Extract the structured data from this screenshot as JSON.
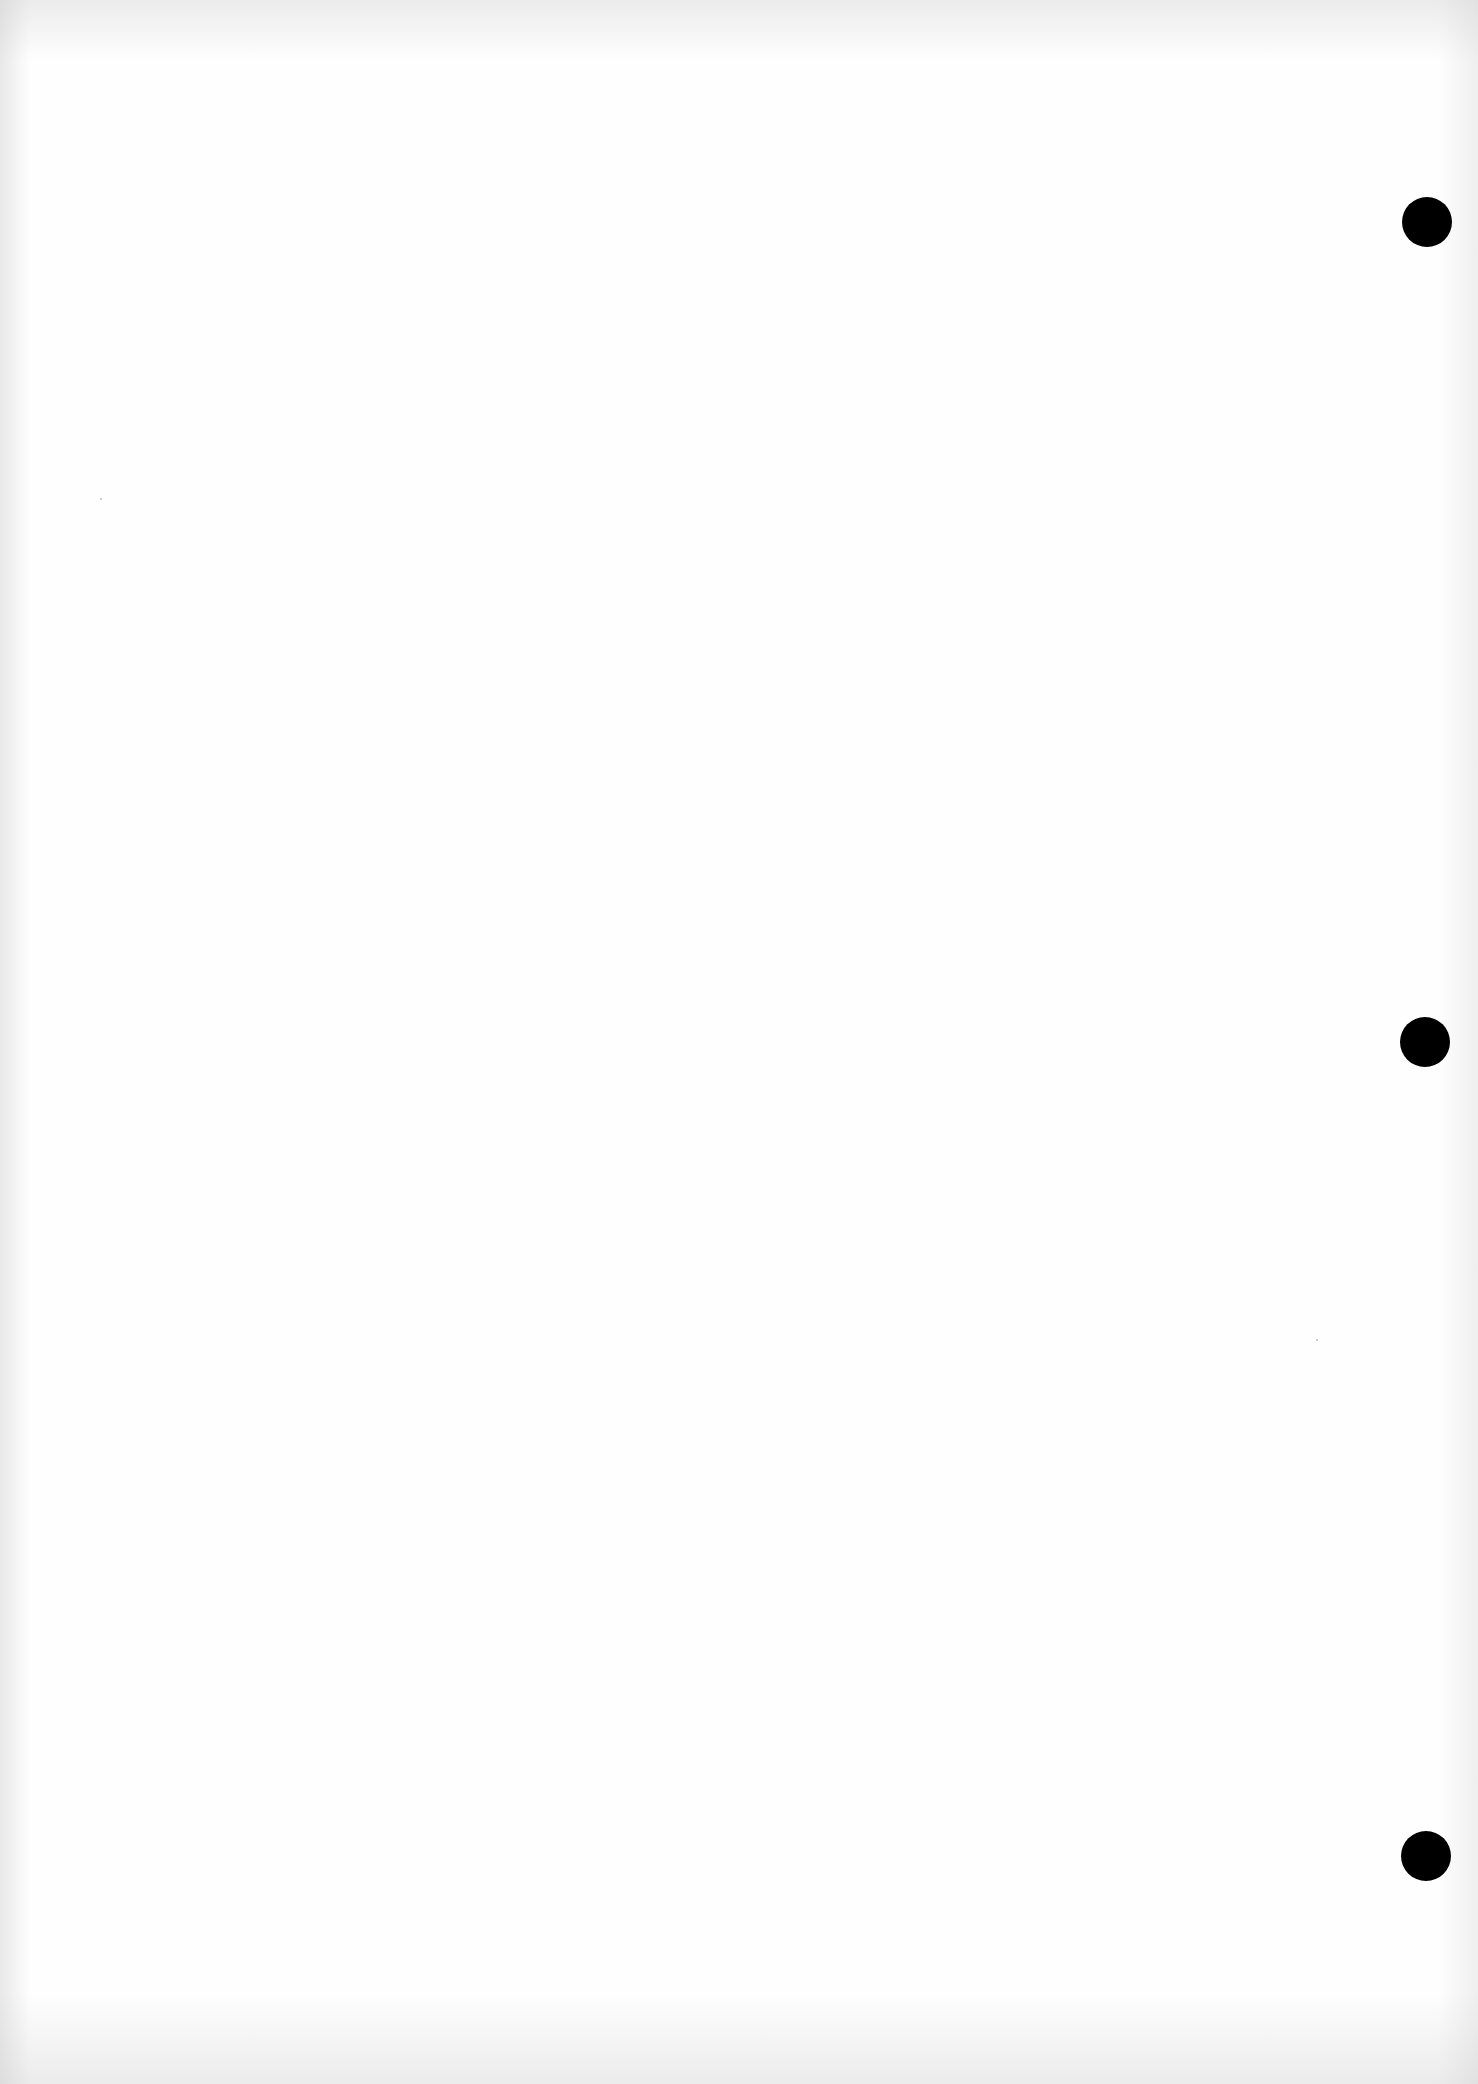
{
  "document": {
    "type": "blank scanned page",
    "background_color": "#fefefe",
    "punch_holes": [
      {
        "x": 1427,
        "y": 222
      },
      {
        "x": 1425,
        "y": 1042
      },
      {
        "x": 1426,
        "y": 1856
      }
    ],
    "hole_color": "#000000"
  }
}
